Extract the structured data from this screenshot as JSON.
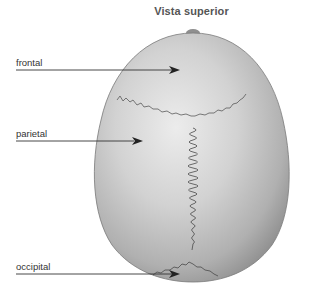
{
  "title": "Vista superior",
  "labels": [
    {
      "name": "frontal",
      "text": "frontal"
    },
    {
      "name": "parietal",
      "text": "parietal"
    },
    {
      "name": "occipital",
      "text": "occipital"
    }
  ],
  "colors": {
    "bone_light": "#e2e2e2",
    "bone_mid": "#bdbdbd",
    "bone_dark": "#8a8a8a",
    "suture": "#555555",
    "arrow": "#333333",
    "text": "#333333"
  }
}
